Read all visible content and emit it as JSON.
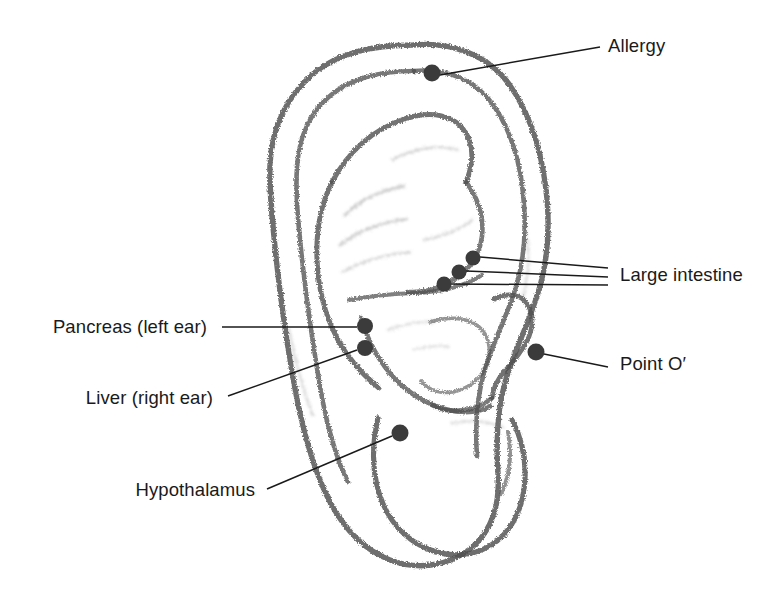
{
  "figure": {
    "background_color": "#ffffff",
    "ink_color": "#4a4a4a",
    "marker_color": "#3b3b3b",
    "leader_color": "#1a1a1a",
    "text_color": "#1a1a1a"
  },
  "points": [
    {
      "id": "allergy",
      "label": "Allergy",
      "side": "right",
      "marker": {
        "cx": 432,
        "cy": 73,
        "r": 8.5
      },
      "leader": [
        [
          440,
          75
        ],
        [
          600,
          47
        ]
      ],
      "text": {
        "x": 608,
        "y": 37
      }
    },
    {
      "id": "large-intestine",
      "label": "Large intestine",
      "side": "right",
      "markers": [
        {
          "cx": 473,
          "cy": 258,
          "r": 7.5
        },
        {
          "cx": 459,
          "cy": 272,
          "r": 7.5
        },
        {
          "cx": 444,
          "cy": 284,
          "r": 7.5
        }
      ],
      "leaders": [
        [
          [
            480,
            257
          ],
          [
            608,
            268
          ]
        ],
        [
          [
            466,
            271
          ],
          [
            608,
            277
          ]
        ],
        [
          [
            451,
            284
          ],
          [
            608,
            285
          ]
        ]
      ],
      "text": {
        "x": 620,
        "y": 266
      }
    },
    {
      "id": "point-o-prime",
      "label": "Point O′",
      "side": "right",
      "marker": {
        "cx": 536,
        "cy": 352,
        "r": 8.5
      },
      "leader": [
        [
          544,
          354
        ],
        [
          608,
          367
        ]
      ],
      "text": {
        "x": 620,
        "y": 355
      }
    },
    {
      "id": "pancreas-left-ear",
      "label": "Pancreas (left ear)",
      "side": "left",
      "marker": {
        "cx": 365,
        "cy": 326,
        "r": 8.0
      },
      "leader": [
        [
          357,
          327
        ],
        [
          222,
          327
        ]
      ],
      "text": {
        "x": 207,
        "y": 318
      }
    },
    {
      "id": "liver-right-ear",
      "label": "Liver (right ear)",
      "side": "left",
      "marker": {
        "cx": 365,
        "cy": 348,
        "r": 8.0
      },
      "leader": [
        [
          357,
          350
        ],
        [
          228,
          396
        ]
      ],
      "text": {
        "x": 213,
        "y": 389
      }
    },
    {
      "id": "hypothalamus",
      "label": "Hypothalamus",
      "side": "left",
      "marker": {
        "cx": 400,
        "cy": 433,
        "r": 8.5
      },
      "leader": [
        [
          392,
          436
        ],
        [
          267,
          489
        ]
      ],
      "text": {
        "x": 255,
        "y": 481
      }
    }
  ]
}
